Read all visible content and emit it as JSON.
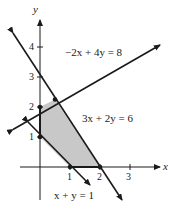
{
  "graph": {
    "axes": {
      "x_label": "x",
      "y_label": "y",
      "x_ticks": [
        "1",
        "2",
        "3"
      ],
      "y_ticks": [
        "1",
        "2",
        "3",
        "4"
      ]
    },
    "lines": [
      {
        "equation": "−2x + 4y = 8",
        "label": "−2x + 4y = 8"
      },
      {
        "equation": "3x + 2y = 6",
        "label": "3x + 2y = 6"
      },
      {
        "equation": "x + y = 1",
        "label": "x + y = 1"
      }
    ],
    "feasible_region": {
      "vertices": [
        [
          0,
          1
        ],
        [
          0,
          2
        ],
        [
          0.5,
          2.25
        ],
        [
          2,
          0
        ],
        [
          1,
          0
        ]
      ],
      "fill": "#c8c8c8"
    },
    "colors": {
      "line": "#1a1a1a",
      "region": "#c8c8c8"
    }
  }
}
